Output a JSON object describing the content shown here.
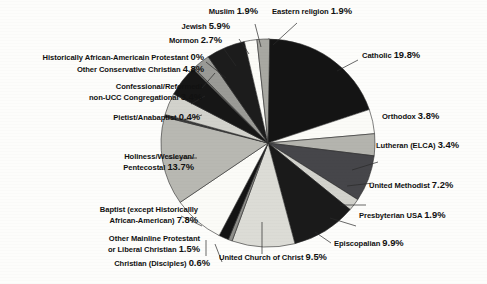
{
  "chart_data": {
    "type": "pie",
    "title": "",
    "subtitle": "",
    "xlabel": "",
    "ylabel": "",
    "legend_position": "callout-labels",
    "grid": false,
    "unit": "%",
    "total": 100,
    "categories": [
      "Catholic",
      "Orthodox",
      "Lutheran (ELCA)",
      "United Methodist",
      "Presbyterian USA",
      "Episcopalian",
      "United Church of Christ",
      "Christian (Disciples)",
      "Other Mainline Protestant or Liberal Christian",
      "Baptist (except Historicallly African-American)",
      "Holiness/Wesleyan/ Pentecostal",
      "Pietist/Anabaptist",
      "Confessional/Reformed/ non-UCC Congregational",
      "Other Conservative Christian",
      "Historically  African-Americain Protestant",
      "Mormon",
      "Jewish",
      "Muslim",
      "Eastern religion"
    ],
    "values": [
      19.8,
      3.8,
      3.4,
      7.2,
      1.9,
      9.9,
      9.5,
      0.6,
      1.5,
      7.8,
      13.7,
      0.4,
      3.4,
      4.8,
      0,
      2.7,
      5.9,
      1.9,
      1.9
    ],
    "slices": [
      {
        "label": "Catholic",
        "label_line1": "Catholic",
        "label_line2": "",
        "value": 19.8,
        "display": "19.8%",
        "fill": "#141414",
        "side": "right"
      },
      {
        "label": "Orthodox",
        "label_line1": "Orthodox",
        "label_line2": "",
        "value": 3.8,
        "display": "3.8%",
        "fill": "#fbfbf7",
        "side": "right"
      },
      {
        "label": "Lutheran (ELCA)",
        "label_line1": "Lutheran (ELCA)",
        "label_line2": "",
        "value": 3.4,
        "display": "3.4%",
        "fill": "#b4b4ae",
        "side": "right"
      },
      {
        "label": "United Methodist",
        "label_line1": "United Methodist",
        "label_line2": "",
        "value": 7.2,
        "display": "7.2%",
        "fill": "#46464a",
        "side": "right"
      },
      {
        "label": "Presbyterian USA",
        "label_line1": "Presbyterian USA",
        "label_line2": "",
        "value": 1.9,
        "display": "1.9%",
        "fill": "#d2d2cc",
        "side": "right"
      },
      {
        "label": "Episcopalian",
        "label_line1": "Episcopalian",
        "label_line2": "",
        "value": 9.9,
        "display": "9.9%",
        "fill": "#1a1a1a",
        "side": "right"
      },
      {
        "label": "United Church of Christ",
        "label_line1": "United Church of Christ",
        "label_line2": "",
        "value": 9.5,
        "display": "9.5%",
        "fill": "#dcdcd6",
        "side": "bottom"
      },
      {
        "label": "Christian (Disciples)",
        "label_line1": "Christian (Disciples)",
        "label_line2": "",
        "value": 0.6,
        "display": "0.6%",
        "fill": "#8e8e8a",
        "side": "bottom"
      },
      {
        "label": "Other Mainline Protestant or Liberal Christian",
        "label_line1": "Other Mainline Protestant",
        "label_line2": "or Liberal Christian",
        "value": 1.5,
        "display": "1.5%",
        "fill": "#141414",
        "side": "bottom"
      },
      {
        "label": "Baptist (except Historicallly African-American)",
        "label_line1": "Baptist (except Historicallly",
        "label_line2": "African-American)",
        "value": 7.8,
        "display": "7.8%",
        "fill": "#fbfbf7",
        "side": "left"
      },
      {
        "label": "Holiness/Wesleyan/ Pentecostal",
        "label_line1": "Holiness/Wesleyan/",
        "label_line2": "Pentecostal",
        "value": 13.7,
        "display": "13.7%",
        "fill": "#b8b8b2",
        "side": "left"
      },
      {
        "label": "Pietist/Anabaptist",
        "label_line1": "Pietist/Anabaptist",
        "label_line2": "",
        "value": 0.4,
        "display": "0.4%",
        "fill": "#3c3c3c",
        "side": "left"
      },
      {
        "label": "Confessional/Reformed/ non-UCC Congregational",
        "label_line1": "Confessional/Reformed/",
        "label_line2": "non-UCC Congregational",
        "value": 3.4,
        "display": "3.4%",
        "fill": "#d2d2cc",
        "side": "left"
      },
      {
        "label": "Other Conservative Christian",
        "label_line1": "Other Conservative Christian",
        "label_line2": "",
        "value": 4.8,
        "display": "4.8%",
        "fill": "#161616",
        "side": "left"
      },
      {
        "label": "Historically  African-Americain Protestant",
        "label_line1": "Historically  African-Americain Protestant",
        "label_line2": "",
        "value": 0,
        "display": "0%",
        "fill": "#6e6e6a",
        "side": "left"
      },
      {
        "label": "Mormon",
        "label_line1": "Mormon",
        "label_line2": "",
        "value": 2.7,
        "display": "2.7%",
        "fill": "#9a9a96",
        "side": "left"
      },
      {
        "label": "Jewish",
        "label_line1": "Jewish",
        "label_line2": "",
        "value": 5.9,
        "display": "5.9%",
        "fill": "#1c1c1c",
        "side": "top"
      },
      {
        "label": "Muslim",
        "label_line1": "Muslim",
        "label_line2": "",
        "value": 1.9,
        "display": "1.9%",
        "fill": "#fbfbf7",
        "side": "top"
      },
      {
        "label": "Eastern religion",
        "label_line1": "Eastern religion",
        "label_line2": "",
        "value": 1.9,
        "display": "1.9%",
        "fill": "#a8a8a2",
        "side": "top"
      }
    ]
  },
  "labels": {
    "muslim": {
      "text": "Muslim",
      "pct": "1.9%"
    },
    "eastern": {
      "text": "Eastern religion",
      "pct": "1.9%"
    },
    "jewish": {
      "text": "Jewish",
      "pct": "5.9%"
    },
    "mormon": {
      "text": "Mormon",
      "pct": "2.7%"
    },
    "historically_aa": {
      "text": "Historically  African-Americain Protestant",
      "pct": "0%"
    },
    "other_conservative": {
      "text": "Other Conservative Christian",
      "pct": "4.8%"
    },
    "confessional_l1": {
      "text": "Confessional/Reformed/"
    },
    "confessional_l2": {
      "text": "non-UCC Congregational",
      "pct": "3.4%"
    },
    "pietist": {
      "text": "Pietist/Anabaptist",
      "pct": "0.4%"
    },
    "holiness_l1": {
      "text": "Holiness/Wesleyan/"
    },
    "holiness_l2": {
      "text": "Pentecostal",
      "pct": "13.7%"
    },
    "baptist_l1": {
      "text": "Baptist (except Historicallly"
    },
    "baptist_l2": {
      "text": "African-American)",
      "pct": "7.8%"
    },
    "other_mainline_l1": {
      "text": "Other Mainline Protestant"
    },
    "other_mainline_l2": {
      "text": "or Liberal Christian",
      "pct": "1.5%"
    },
    "disciples": {
      "text": "Christian (Disciples)",
      "pct": "0.6%"
    },
    "ucc": {
      "text": "United Church of Christ",
      "pct": "9.5%"
    },
    "episcopalian": {
      "text": "Episcopalian",
      "pct": "9.9%"
    },
    "presbyterian": {
      "text": "Presbyterian USA",
      "pct": "1.9%"
    },
    "united_methodist": {
      "text": "United Methodist",
      "pct": "7.2%"
    },
    "lutheran": {
      "text": "Lutheran (ELCA)",
      "pct": "3.4%"
    },
    "orthodox": {
      "text": "Orthodox",
      "pct": "3.8%"
    },
    "catholic": {
      "text": "Catholic",
      "pct": "19.8%"
    }
  },
  "colors": {
    "background": "#fdfdfb",
    "text": "#111111",
    "slice_dark": "#141414",
    "slice_white": "#fbfbf7",
    "slice_light_gray": "#d2d2cc",
    "slice_mid_gray": "#9a9a96",
    "slice_dark_gray": "#46464a",
    "outline": "#2a2a2a"
  }
}
